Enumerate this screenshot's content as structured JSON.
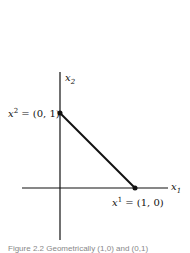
{
  "diagram": {
    "axes": {
      "x_label": "x",
      "x_sub": "1",
      "y_label": "x",
      "y_sub": "2"
    },
    "points": [
      {
        "name": "x",
        "sup": "2",
        "coords": "= (0, 1)"
      },
      {
        "name": "x",
        "sup": "1",
        "coords": "= (1, 0)"
      }
    ],
    "segment": "line from (0,1) to (1,0)",
    "caption": "Figure 2.2  Geometrically (1,0) and (0,1)"
  }
}
